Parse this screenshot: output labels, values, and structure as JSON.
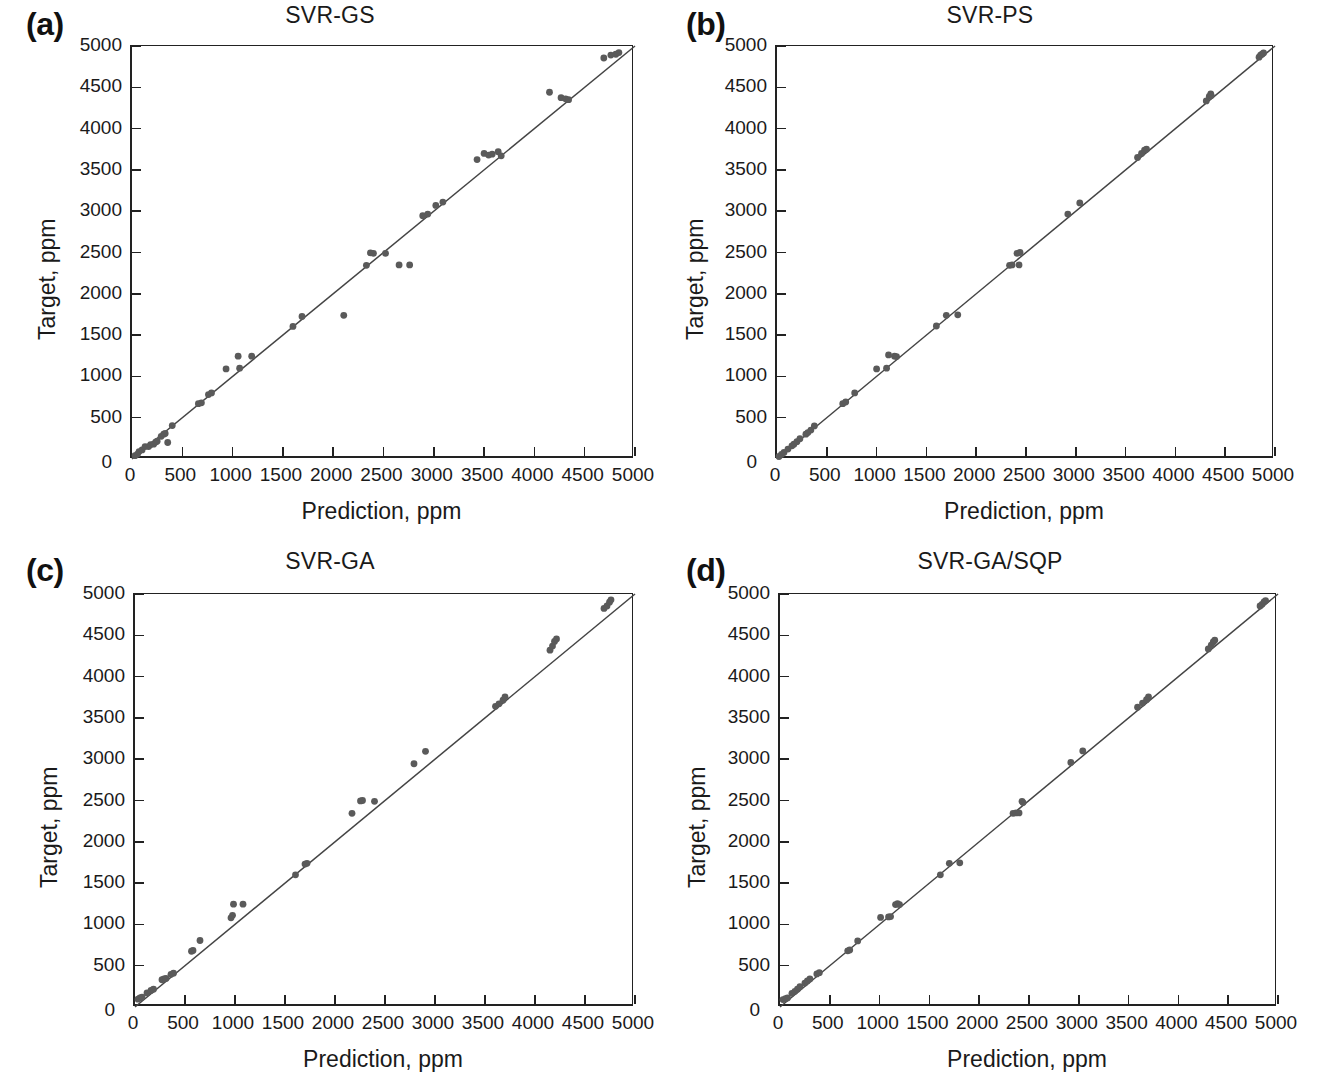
{
  "figure": {
    "panel_count": 4,
    "axis_titles": {
      "x": "Prediction, ppm",
      "y": "Target, ppm"
    },
    "tick_labels": [
      "0",
      "500",
      "1000",
      "1500",
      "2000",
      "2500",
      "3000",
      "3500",
      "4000",
      "4500",
      "5000"
    ],
    "point_color": "#5a5a5a",
    "line_color": "#444444"
  },
  "panels": [
    {
      "tag": "(a)",
      "title": "SVR-GS"
    },
    {
      "tag": "(b)",
      "title": "SVR-PS"
    },
    {
      "tag": "(c)",
      "title": "SVR-GA"
    },
    {
      "tag": "(d)",
      "title": "SVR-GA/SQP"
    }
  ],
  "chart_data": [
    {
      "type": "scatter",
      "title": "SVR-GS",
      "panel": "(a)",
      "xlabel": "Prediction, ppm",
      "ylabel": "Target, ppm",
      "xlim": [
        0,
        5000
      ],
      "ylim": [
        0,
        5000
      ],
      "xticks": [
        0,
        500,
        1000,
        1500,
        2000,
        2500,
        3000,
        3500,
        4000,
        4500,
        5000
      ],
      "yticks": [
        0,
        500,
        1000,
        1500,
        2000,
        2500,
        3000,
        3500,
        4000,
        4500,
        5000
      ],
      "grid": false,
      "legend": null,
      "reference_line": {
        "type": "identity",
        "from": [
          0,
          0
        ],
        "to": [
          5000,
          5000
        ]
      },
      "points": [
        [
          30,
          40
        ],
        [
          55,
          60
        ],
        [
          70,
          90
        ],
        [
          100,
          110
        ],
        [
          130,
          150
        ],
        [
          165,
          150
        ],
        [
          185,
          175
        ],
        [
          215,
          180
        ],
        [
          235,
          205
        ],
        [
          250,
          215
        ],
        [
          290,
          275
        ],
        [
          315,
          300
        ],
        [
          330,
          310
        ],
        [
          355,
          200
        ],
        [
          400,
          405
        ],
        [
          660,
          670
        ],
        [
          690,
          680
        ],
        [
          760,
          780
        ],
        [
          790,
          800
        ],
        [
          935,
          1090
        ],
        [
          1055,
          1245
        ],
        [
          1070,
          1100
        ],
        [
          1190,
          1245
        ],
        [
          1600,
          1605
        ],
        [
          1690,
          1725
        ],
        [
          2105,
          1740
        ],
        [
          2330,
          2345
        ],
        [
          2370,
          2495
        ],
        [
          2400,
          2490
        ],
        [
          2520,
          2490
        ],
        [
          2655,
          2350
        ],
        [
          2760,
          2350
        ],
        [
          2890,
          2945
        ],
        [
          2940,
          2965
        ],
        [
          3020,
          3070
        ],
        [
          3090,
          3110
        ],
        [
          3430,
          3625
        ],
        [
          3500,
          3700
        ],
        [
          3545,
          3680
        ],
        [
          3580,
          3690
        ],
        [
          3640,
          3720
        ],
        [
          3670,
          3670
        ],
        [
          4150,
          4440
        ],
        [
          4265,
          4375
        ],
        [
          4310,
          4360
        ],
        [
          4340,
          4350
        ],
        [
          4690,
          4855
        ],
        [
          4760,
          4890
        ],
        [
          4810,
          4900
        ],
        [
          4840,
          4920
        ]
      ]
    },
    {
      "type": "scatter",
      "title": "SVR-PS",
      "panel": "(b)",
      "xlabel": "Prediction, ppm",
      "ylabel": "Target, ppm",
      "xlim": [
        0,
        5000
      ],
      "ylim": [
        0,
        5000
      ],
      "xticks": [
        0,
        500,
        1000,
        1500,
        2000,
        2500,
        3000,
        3500,
        4000,
        4500,
        5000
      ],
      "yticks": [
        0,
        500,
        1000,
        1500,
        2000,
        2500,
        3000,
        3500,
        4000,
        4500,
        5000
      ],
      "grid": false,
      "legend": null,
      "reference_line": {
        "type": "identity",
        "from": [
          0,
          0
        ],
        "to": [
          5000,
          5000
        ]
      },
      "points": [
        [
          20,
          30
        ],
        [
          45,
          55
        ],
        [
          70,
          80
        ],
        [
          110,
          120
        ],
        [
          150,
          160
        ],
        [
          170,
          180
        ],
        [
          200,
          210
        ],
        [
          230,
          245
        ],
        [
          290,
          300
        ],
        [
          310,
          320
        ],
        [
          340,
          350
        ],
        [
          375,
          400
        ],
        [
          660,
          670
        ],
        [
          690,
          690
        ],
        [
          780,
          800
        ],
        [
          1000,
          1090
        ],
        [
          1100,
          1100
        ],
        [
          1120,
          1260
        ],
        [
          1180,
          1245
        ],
        [
          1200,
          1240
        ],
        [
          1600,
          1610
        ],
        [
          1700,
          1740
        ],
        [
          1815,
          1745
        ],
        [
          2335,
          2345
        ],
        [
          2360,
          2350
        ],
        [
          2410,
          2490
        ],
        [
          2430,
          2350
        ],
        [
          2440,
          2500
        ],
        [
          2920,
          2965
        ],
        [
          3040,
          3100
        ],
        [
          3620,
          3650
        ],
        [
          3660,
          3700
        ],
        [
          3690,
          3740
        ],
        [
          3710,
          3750
        ],
        [
          4310,
          4335
        ],
        [
          4340,
          4390
        ],
        [
          4355,
          4420
        ],
        [
          4360,
          4400
        ],
        [
          4840,
          4865
        ],
        [
          4855,
          4890
        ],
        [
          4870,
          4900
        ],
        [
          4885,
          4915
        ]
      ]
    },
    {
      "type": "scatter",
      "title": "SVR-GA",
      "panel": "(c)",
      "xlabel": "Prediction, ppm",
      "ylabel": "Target, ppm",
      "xlim": [
        0,
        5000
      ],
      "ylim": [
        0,
        5000
      ],
      "xticks": [
        0,
        500,
        1000,
        1500,
        2000,
        2500,
        3000,
        3500,
        4000,
        4500,
        5000
      ],
      "yticks": [
        0,
        500,
        1000,
        1500,
        2000,
        2500,
        3000,
        3500,
        4000,
        4500,
        5000
      ],
      "grid": false,
      "legend": null,
      "reference_line": {
        "type": "identity",
        "from": [
          0,
          0
        ],
        "to": [
          5000,
          5000
        ]
      },
      "points": [
        [
          30,
          95
        ],
        [
          50,
          110
        ],
        [
          70,
          120
        ],
        [
          120,
          170
        ],
        [
          160,
          200
        ],
        [
          185,
          215
        ],
        [
          270,
          330
        ],
        [
          290,
          340
        ],
        [
          310,
          345
        ],
        [
          360,
          395
        ],
        [
          385,
          410
        ],
        [
          565,
          675
        ],
        [
          580,
          685
        ],
        [
          650,
          805
        ],
        [
          960,
          1080
        ],
        [
          975,
          1110
        ],
        [
          985,
          1245
        ],
        [
          1080,
          1245
        ],
        [
          1605,
          1600
        ],
        [
          1700,
          1730
        ],
        [
          1720,
          1740
        ],
        [
          2170,
          2345
        ],
        [
          2255,
          2495
        ],
        [
          2275,
          2500
        ],
        [
          2395,
          2490
        ],
        [
          2790,
          2945
        ],
        [
          2905,
          3095
        ],
        [
          3605,
          3640
        ],
        [
          3640,
          3670
        ],
        [
          3680,
          3715
        ],
        [
          3700,
          3755
        ],
        [
          4150,
          4320
        ],
        [
          4175,
          4370
        ],
        [
          4195,
          4425
        ],
        [
          4215,
          4455
        ],
        [
          4690,
          4825
        ],
        [
          4720,
          4855
        ],
        [
          4745,
          4900
        ],
        [
          4760,
          4930
        ]
      ]
    },
    {
      "type": "scatter",
      "title": "SVR-GA/SQP",
      "panel": "(d)",
      "xlabel": "Prediction, ppm",
      "ylabel": "Target, ppm",
      "xlim": [
        0,
        5000
      ],
      "ylim": [
        0,
        5000
      ],
      "xticks": [
        0,
        500,
        1000,
        1500,
        2000,
        2500,
        3000,
        3500,
        4000,
        4500,
        5000
      ],
      "yticks": [
        0,
        500,
        1000,
        1500,
        2000,
        2500,
        3000,
        3500,
        4000,
        4500,
        5000
      ],
      "grid": false,
      "legend": null,
      "reference_line": {
        "type": "identity",
        "from": [
          0,
          0
        ],
        "to": [
          5000,
          5000
        ]
      },
      "points": [
        [
          30,
          90
        ],
        [
          55,
          100
        ],
        [
          75,
          110
        ],
        [
          120,
          165
        ],
        [
          150,
          190
        ],
        [
          175,
          215
        ],
        [
          200,
          245
        ],
        [
          250,
          290
        ],
        [
          275,
          315
        ],
        [
          300,
          340
        ],
        [
          370,
          400
        ],
        [
          395,
          415
        ],
        [
          680,
          680
        ],
        [
          700,
          690
        ],
        [
          780,
          800
        ],
        [
          1010,
          1085
        ],
        [
          1090,
          1090
        ],
        [
          1110,
          1095
        ],
        [
          1160,
          1240
        ],
        [
          1180,
          1250
        ],
        [
          1200,
          1240
        ],
        [
          1610,
          1600
        ],
        [
          1700,
          1740
        ],
        [
          1805,
          1745
        ],
        [
          2340,
          2345
        ],
        [
          2370,
          2350
        ],
        [
          2400,
          2350
        ],
        [
          2430,
          2490
        ],
        [
          2440,
          2475
        ],
        [
          2920,
          2960
        ],
        [
          3040,
          3100
        ],
        [
          3590,
          3630
        ],
        [
          3640,
          3680
        ],
        [
          3680,
          3720
        ],
        [
          3700,
          3755
        ],
        [
          4300,
          4335
        ],
        [
          4330,
          4380
        ],
        [
          4350,
          4420
        ],
        [
          4365,
          4440
        ],
        [
          4820,
          4855
        ],
        [
          4840,
          4875
        ],
        [
          4860,
          4905
        ],
        [
          4875,
          4920
        ]
      ]
    }
  ]
}
